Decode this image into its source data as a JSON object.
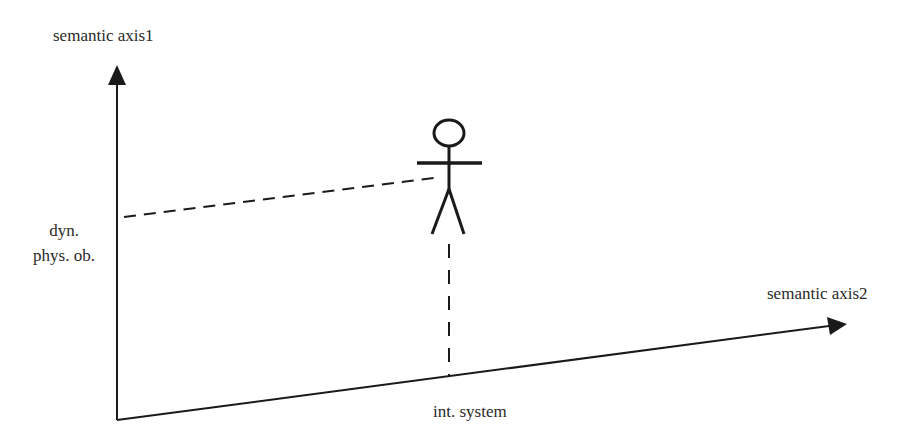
{
  "diagram": {
    "type": "semantic-axes-diagram",
    "axes": {
      "y": {
        "label": "semantic axis1"
      },
      "x": {
        "label": "semantic axis2"
      }
    },
    "marks": {
      "y_mark": {
        "line1": "dyn.",
        "line2": "phys. ob."
      },
      "x_mark": {
        "label": "int. system"
      }
    },
    "figure": {
      "kind": "stick-figure",
      "name": "actor"
    },
    "colors": {
      "stroke": "#1a1a1a",
      "text": "#2a2a2a",
      "background": "#ffffff"
    }
  }
}
